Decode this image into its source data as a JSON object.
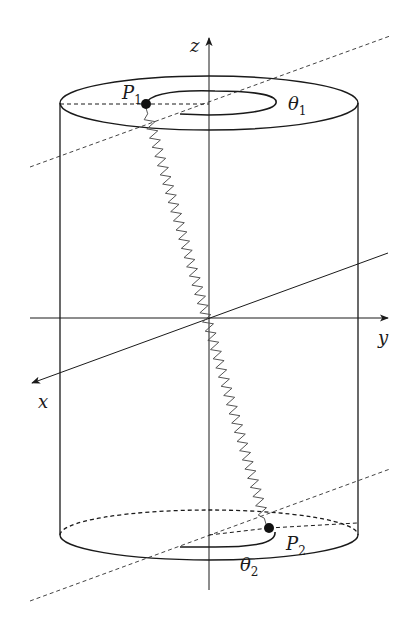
{
  "figure": {
    "colors": {
      "stroke": "#1a1a1a",
      "spring": "#555555",
      "dashed": "#444444",
      "background": "#ffffff"
    },
    "axes": {
      "x": {
        "label": "x"
      },
      "y": {
        "label": "y"
      },
      "z": {
        "label": "z"
      }
    },
    "points": {
      "p1": {
        "label": "P",
        "subscript": "1"
      },
      "p2": {
        "label": "P",
        "subscript": "2"
      }
    },
    "angles": {
      "theta1": {
        "label": "θ",
        "subscript": "1"
      },
      "theta2": {
        "label": "θ",
        "subscript": "2"
      }
    },
    "spring": {
      "coils": 44
    }
  }
}
